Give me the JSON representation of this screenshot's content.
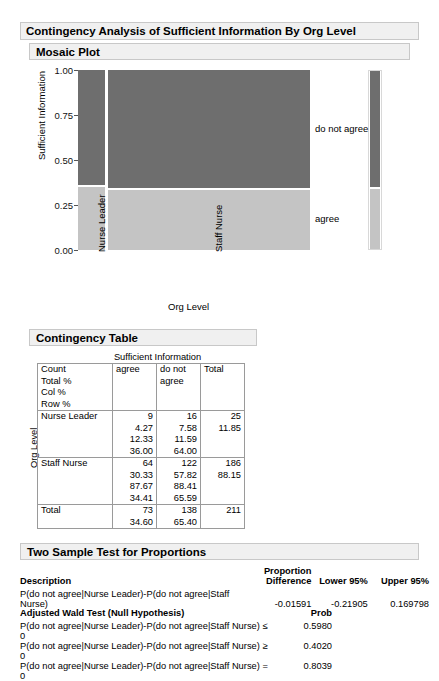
{
  "report": {
    "title": "Contingency Analysis of Sufficient Information By Org Level",
    "mosaic_title": "Mosaic Plot",
    "contingency_title": "Contingency Table",
    "twosample_title": "Two Sample Test for Proportions"
  },
  "chart_data": {
    "type": "mosaic",
    "title": "Mosaic Plot",
    "xlabel": "Org Level",
    "ylabel": "Sufficient Information",
    "ylim": [
      0,
      1
    ],
    "yticks": [
      "0.00",
      "0.25",
      "0.50",
      "0.75",
      "1.00"
    ],
    "ytick_values": [
      0,
      0.25,
      0.5,
      0.75,
      1
    ],
    "categories": [
      "Nurse Leader",
      "Staff Nurse"
    ],
    "category_widths": [
      25,
      186
    ],
    "response_levels": [
      "agree",
      "do not agree"
    ],
    "legend_labels": [
      "do not agree",
      "agree"
    ],
    "legend_position": "right",
    "colors": {
      "do_not_agree": "#6e6e6e",
      "agree": "#c4c4c4",
      "plot_bg": "#ffffff"
    },
    "series": [
      {
        "name": "do not agree",
        "values": [
          64.0,
          65.59
        ],
        "color": "#6e6e6e"
      },
      {
        "name": "agree",
        "values": [
          36.0,
          34.41
        ],
        "color": "#c4c4c4"
      }
    ],
    "marginal_bar": {
      "do not agree": 65.4,
      "agree": 34.6
    }
  },
  "contingency_table": {
    "supra_header": "Sufficient Information",
    "row_label": "Org Level",
    "stub_legend": [
      "Count",
      "Total %",
      "Col %",
      "Row %"
    ],
    "columns": [
      "agree",
      "do not agree",
      "Total"
    ],
    "rows": [
      {
        "label": "Nurse Leader",
        "agree": [
          "9",
          "4.27",
          "12.33",
          "36.00"
        ],
        "do_not_agree": [
          "16",
          "7.58",
          "11.59",
          "64.00"
        ],
        "total": [
          "25",
          "11.85",
          "",
          ""
        ]
      },
      {
        "label": "Staff Nurse",
        "agree": [
          "64",
          "30.33",
          "87.67",
          "34.41"
        ],
        "do_not_agree": [
          "122",
          "57.82",
          "88.41",
          "65.59"
        ],
        "total": [
          "186",
          "88.15",
          "",
          ""
        ]
      },
      {
        "label": "Total",
        "agree": [
          "73",
          "34.60"
        ],
        "do_not_agree": [
          "138",
          "65.40"
        ],
        "total": [
          "211",
          ""
        ]
      }
    ]
  },
  "two_sample_test": {
    "headers": {
      "description": "Description",
      "prop_line1": "Proportion",
      "prop_line2": "Difference",
      "lower": "Lower 95%",
      "upper": "Upper 95%"
    },
    "row": {
      "description": "P(do not agree|Nurse Leader)-P(do not agree|Staff Nurse)",
      "difference": "-0.01591",
      "lower": "-0.21905",
      "upper": "0.169798"
    },
    "wald": {
      "title": "Adjusted Wald Test (Null Hypothesis)",
      "prob_header": "Prob",
      "rows": [
        {
          "hypothesis": "P(do not agree|Nurse Leader)-P(do not agree|Staff Nurse) ≤ 0",
          "prob": "0.5980"
        },
        {
          "hypothesis": "P(do not agree|Nurse Leader)-P(do not agree|Staff Nurse) ≥ 0",
          "prob": "0.4020"
        },
        {
          "hypothesis": "P(do not agree|Nurse Leader)-P(do not agree|Staff Nurse) = 0",
          "prob": "0.8039"
        }
      ]
    }
  }
}
